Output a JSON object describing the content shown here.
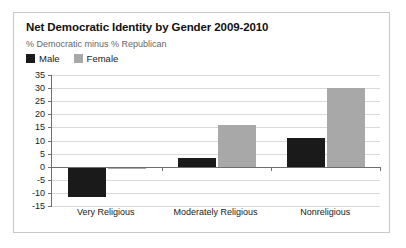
{
  "chart_data": {
    "type": "bar",
    "title": "Net Democratic Identity by Gender 2009-2010",
    "subtitle": "% Democratic minus % Republican",
    "xlabel": "",
    "ylabel": "",
    "ylim": [
      -15,
      35
    ],
    "ytick_step": 5,
    "yticks": [
      35,
      30,
      25,
      20,
      15,
      10,
      5,
      0,
      -5,
      -10,
      -15
    ],
    "grid": true,
    "legend_position": "top-left",
    "categories": [
      "Very Religious",
      "Moderately Religious",
      "Nonreligious"
    ],
    "series": [
      {
        "name": "Male",
        "color": "#1a1a1a",
        "values": [
          -11.5,
          3.5,
          11
        ]
      },
      {
        "name": "Female",
        "color": "#a8a8a8",
        "values": [
          -1,
          16,
          30
        ]
      }
    ]
  },
  "frame": {
    "border_color": "#c8c8c8",
    "background": "#ffffff",
    "axis_color": "#6e6e6e",
    "grid_color": "#d9d9d9"
  }
}
